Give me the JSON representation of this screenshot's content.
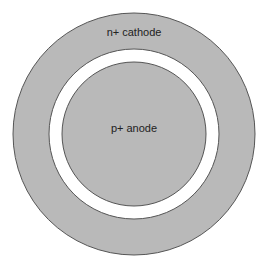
{
  "diagram": {
    "type": "concentric-rings",
    "colors": {
      "region_fill": "#b9b9b9",
      "gap_fill": "#ffffff",
      "stroke": "#555555",
      "background": "#ffffff"
    },
    "outer_region": {
      "label": "n+ cathode"
    },
    "inner_region": {
      "label": "p+ anode"
    }
  }
}
